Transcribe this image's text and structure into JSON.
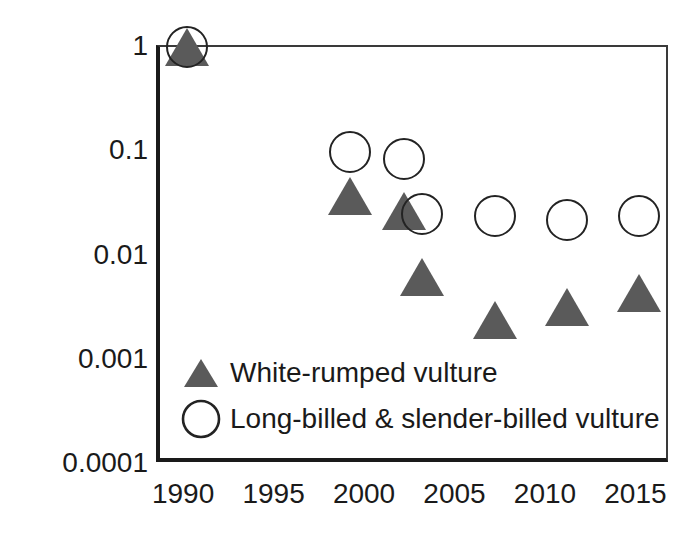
{
  "chart_data": {
    "type": "scatter",
    "title": "",
    "subtitle": "",
    "xlabel": "",
    "ylabel": "Population index",
    "xlim": [
      1988.5,
      2016.8
    ],
    "ylim": [
      0.0001,
      1
    ],
    "yscale": "log",
    "xscale": "linear",
    "grid": false,
    "legend_position": "inside-bottom-left",
    "x_ticks": [
      "1990",
      "1995",
      "2000",
      "2005",
      "2010",
      "2015"
    ],
    "x_tick_values": [
      1990,
      1995,
      2000,
      2005,
      2010,
      2015
    ],
    "y_ticks": [
      "1",
      "0.1",
      "0.01",
      "0.001",
      "0.0001"
    ],
    "y_tick_values": [
      1,
      0.1,
      0.01,
      0.001,
      0.0001
    ],
    "series": [
      {
        "name": "White-rumped vulture",
        "marker": "triangle",
        "color": "#5a5a5a",
        "x": [
          1990,
          1999,
          2002,
          2003,
          2007,
          2011,
          2015
        ],
        "values": [
          1.0,
          0.037,
          0.027,
          0.0062,
          0.0024,
          0.0032,
          0.0044
        ]
      },
      {
        "name": "Long-billed & slender-billed vulture",
        "marker": "circle",
        "color": "#232323",
        "x": [
          1990,
          1999,
          2002,
          2003,
          2007,
          2011,
          2015
        ],
        "values": [
          1.0,
          0.098,
          0.085,
          0.025,
          0.024,
          0.022,
          0.024
        ]
      }
    ]
  },
  "legend": {
    "items": [
      {
        "label": "White-rumped vulture",
        "marker": "triangle"
      },
      {
        "label": "Long-billed & slender-billed vulture",
        "marker": "circle"
      }
    ]
  },
  "colors": {
    "triangle_fill": "#5a5a5a",
    "circle_stroke": "#232323",
    "axis": "#1a1a1a",
    "text": "#1a1a1a",
    "background": "#ffffff"
  }
}
